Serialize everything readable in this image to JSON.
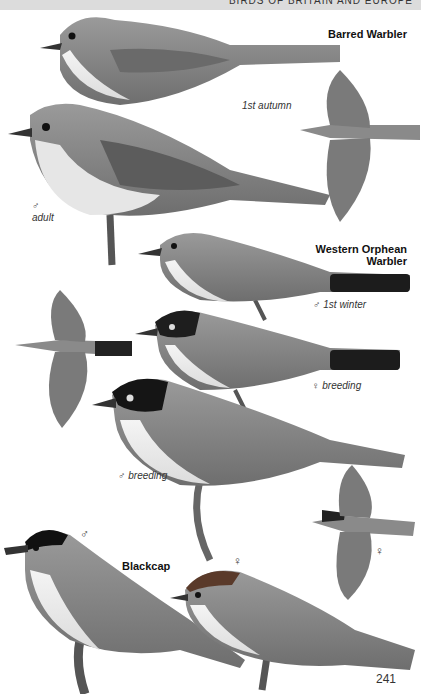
{
  "header": {
    "running_title": "BIRDS OF BRITAIN AND EUROPE"
  },
  "species": [
    {
      "name": "Barred Warbler",
      "captions": [
        "1st autumn",
        "♂ adult"
      ]
    },
    {
      "name_line1": "Western Orphean",
      "name_line2": "Warbler",
      "captions": [
        "♂ 1st winter",
        "♀ breeding",
        "♂ breeding"
      ]
    },
    {
      "name": "Blackcap",
      "captions": [
        "♂",
        "♀",
        "♀"
      ]
    }
  ],
  "labels": {
    "barred_1st_autumn": "1st autumn",
    "barred_adult_sym": "♂",
    "barred_adult": "adult",
    "orphean_1st_winter": "♂ 1st winter",
    "orphean_female_breeding": "♀ breeding",
    "orphean_male_breeding": "♂ breeding",
    "blackcap_male": "♂",
    "blackcap_female": "♀",
    "blackcap_flight_female": "♀"
  },
  "page_number": "241",
  "colors": {
    "plumage_grey": "#8a8a8a",
    "dark_cap": "#1a1a1a",
    "underparts": "#f2f2f2"
  }
}
